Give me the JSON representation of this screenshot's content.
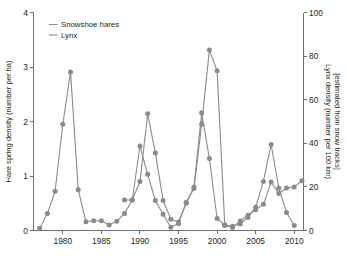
{
  "chart_data": {
    "type": "line",
    "title": "",
    "xlabel": "",
    "ylabel": "Hare spring density (number per ha)",
    "y2label_line1": "Lynx density (number per 100 km)",
    "y2label_line2": "[estimated from snow tracks]",
    "x": [
      1977,
      1978,
      1979,
      1980,
      1981,
      1982,
      1983,
      1984,
      1985,
      1986,
      1987,
      1988,
      1989,
      1990,
      1991,
      1992,
      1993,
      1994,
      1995,
      1996,
      1997,
      1998,
      1999,
      2000,
      2001,
      2002,
      2003,
      2004,
      2005,
      2006,
      2007,
      2008,
      2009,
      2010,
      2011
    ],
    "xlim": [
      1976.2,
      2011.2
    ],
    "xticks": [
      1980,
      1985,
      1990,
      1995,
      2000,
      2005,
      2010
    ],
    "xticklabels": [
      "1980",
      "1985",
      "1990",
      "1995",
      "2000",
      "2005",
      "2010"
    ],
    "ylim": [
      0,
      4
    ],
    "yticks": [
      0,
      1,
      2,
      3,
      4
    ],
    "yticklabels": [
      "0",
      "1",
      "2",
      "3",
      "4"
    ],
    "y2lim": [
      0,
      100
    ],
    "y2ticks": [
      0,
      20,
      40,
      60,
      80,
      100
    ],
    "y2ticklabels": [
      "0",
      "20",
      "40",
      "60",
      "80",
      "100"
    ],
    "grid": false,
    "legend_position": "upper-left",
    "series": [
      {
        "name": "Snowshoe hares",
        "axis": "left",
        "marker": "circle",
        "color": "#8b8b8b",
        "values": [
          0.04,
          0.31,
          0.72,
          1.95,
          2.91,
          0.75,
          0.16,
          0.18,
          0.18,
          0.1,
          0.17,
          0.31,
          0.56,
          1.55,
          1.03,
          0.55,
          0.3,
          0.06,
          0.13,
          0.52,
          0.77,
          1.95,
          3.31,
          2.93,
          0.09,
          0.08,
          0.12,
          0.24,
          0.43,
          0.9,
          1.58,
          0.78,
          0.33,
          0.09,
          null
        ]
      },
      {
        "name": "Lynx",
        "axis": "right",
        "marker": "circle",
        "color": "#8b8b8b",
        "values": [
          null,
          null,
          null,
          null,
          null,
          null,
          null,
          null,
          null,
          null,
          null,
          14.0,
          14.0,
          22.5,
          53.5,
          35.5,
          13.8,
          5.2,
          3.9,
          12.5,
          20.0,
          54.0,
          33.0,
          5.5,
          2.5,
          1.4,
          4.4,
          7.0,
          9.5,
          12.0,
          22.2,
          17.0,
          19.5,
          20.0,
          22.8
        ]
      }
    ],
    "legend": [
      {
        "label": "Snowshoe hares",
        "color": "#8b8b8b"
      },
      {
        "label": "Lynx",
        "color": "#8b8b8b"
      }
    ]
  }
}
